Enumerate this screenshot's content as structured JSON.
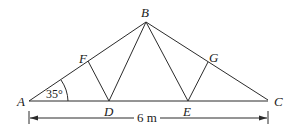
{
  "diagram": {
    "type": "roof truss",
    "points": {
      "A": {
        "label": "A",
        "x": 29,
        "y": 101
      },
      "B": {
        "label": "B",
        "x": 146,
        "y": 22
      },
      "C": {
        "label": "C",
        "x": 268,
        "y": 100
      },
      "D": {
        "label": "D",
        "x": 109,
        "y": 101
      },
      "E": {
        "label": "E",
        "x": 188,
        "y": 101
      },
      "F": {
        "label": "F",
        "x": 88,
        "y": 61
      },
      "G": {
        "label": "G",
        "x": 208,
        "y": 62
      }
    },
    "members": [
      "AB",
      "BC",
      "AC",
      "FD",
      "DB",
      "BE",
      "EG"
    ],
    "angle": {
      "vertex": "A",
      "value": "35°"
    },
    "dimension": {
      "from": "A",
      "to": "C",
      "label": "6 m"
    }
  }
}
